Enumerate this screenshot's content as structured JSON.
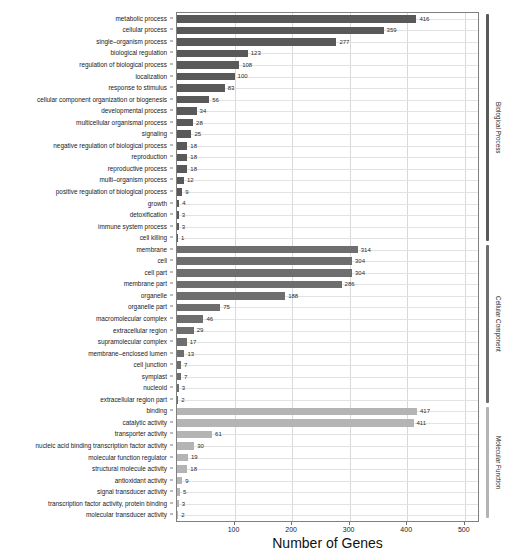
{
  "chart_data": {
    "type": "bar",
    "orientation": "horizontal",
    "title": "",
    "xlabel": "Number of Genes",
    "ylabel": "",
    "xlim": [
      0,
      523
    ],
    "xticks": [
      100,
      200,
      300,
      400,
      500
    ],
    "xticklabels": [
      "100",
      "200",
      "300",
      "400",
      "500"
    ],
    "grid": true,
    "legend_position": "right-axis-brackets",
    "categories": [
      "metabolic process",
      "cellular process",
      "single–organism process",
      "biological regulation",
      "regulation of biological process",
      "localization",
      "response to stimulus",
      "cellular component organization or biogenesis",
      "developmental process",
      "multicellular organismal process",
      "signaling",
      "negative regulation of biological process",
      "reproduction",
      "reproductive process",
      "multi–organism process",
      "positive regulation of biological process",
      "growth",
      "detoxification",
      "immune system process",
      "cell killing",
      "membrane",
      "cell",
      "cell part",
      "membrane part",
      "organelle",
      "organelle part",
      "macromolecular complex",
      "extracellular region",
      "supramolecular complex",
      "membrane–enclosed lumen",
      "cell junction",
      "symplast",
      "nucleoid",
      "extracellular region part",
      "binding",
      "catalytic activity",
      "transporter activity",
      "nucleic acid binding transcription factor activity",
      "molecular function regulator",
      "structural molecule activity",
      "antioxidant activity",
      "signal transducer activity",
      "transcription factor activity, protein binding",
      "molecular transducer activity"
    ],
    "values": [
      416,
      359,
      277,
      123,
      108,
      100,
      83,
      56,
      34,
      28,
      25,
      18,
      18,
      18,
      12,
      9,
      4,
      3,
      3,
      1,
      314,
      304,
      304,
      286,
      188,
      75,
      46,
      29,
      17,
      13,
      7,
      7,
      3,
      2,
      417,
      411,
      61,
      30,
      19,
      18,
      9,
      5,
      3,
      2
    ],
    "groups": [
      {
        "name": "Biological Process",
        "start_index": 0,
        "end_index": 19,
        "color": "#595959"
      },
      {
        "name": "Cellular Component",
        "start_index": 20,
        "end_index": 33,
        "color": "#6e6e6e"
      },
      {
        "name": "Molecular Function",
        "start_index": 34,
        "end_index": 43,
        "color": "#b4b4b4"
      }
    ]
  }
}
